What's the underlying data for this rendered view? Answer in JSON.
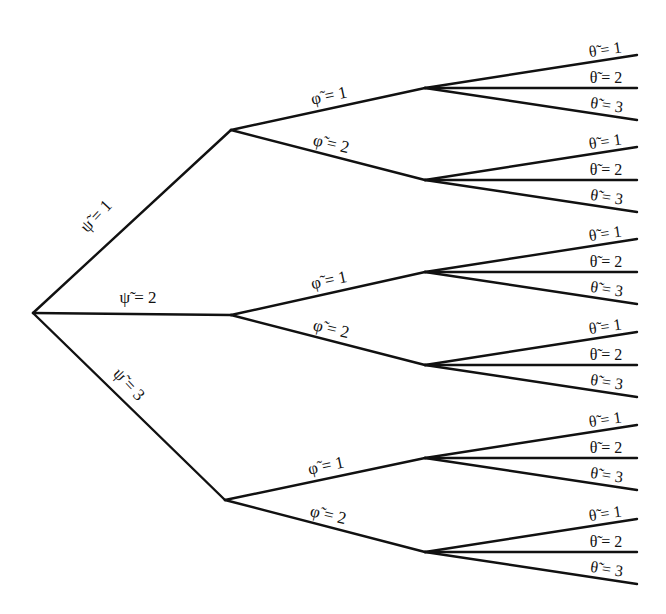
{
  "diagram": {
    "type": "probability-tree",
    "root": {
      "x": 33,
      "y": 313
    },
    "levels": [
      "psi",
      "phi",
      "theta"
    ],
    "level1": [
      {
        "label": "ψ̃ = 1",
        "x": 231,
        "y": 130,
        "lx": 100,
        "ly": 220,
        "rot": -47
      },
      {
        "label": "ψ̃ = 2",
        "x": 231,
        "y": 315,
        "lx": 138,
        "ly": 303,
        "rot": 0
      },
      {
        "label": "ψ̃ = 3",
        "x": 225,
        "y": 500,
        "lx": 125,
        "ly": 388,
        "rot": 47
      }
    ],
    "level2_labels": [
      "φ̃ = 1",
      "φ̃ = 2"
    ],
    "level3_labels": [
      "θ̃ = 1",
      "θ̃ = 2",
      "θ̃ = 3"
    ],
    "level2": [
      {
        "parent": 0,
        "label": "φ̃ = 1",
        "x": 425,
        "y": 88,
        "rot": -12
      },
      {
        "parent": 0,
        "label": "φ̃ = 2",
        "x": 425,
        "y": 180,
        "rot": 13
      },
      {
        "parent": 1,
        "label": "φ̃ = 1",
        "x": 425,
        "y": 272,
        "rot": -12
      },
      {
        "parent": 1,
        "label": "φ̃ = 2",
        "x": 425,
        "y": 365,
        "rot": 13
      },
      {
        "parent": 2,
        "label": "φ̃ = 1",
        "x": 425,
        "y": 458,
        "rot": -12
      },
      {
        "parent": 2,
        "label": "φ̃ = 2",
        "x": 425,
        "y": 552,
        "rot": 13
      }
    ],
    "leaf_end_x": 637,
    "leaf_offsets": [
      -33,
      0,
      32
    ]
  }
}
